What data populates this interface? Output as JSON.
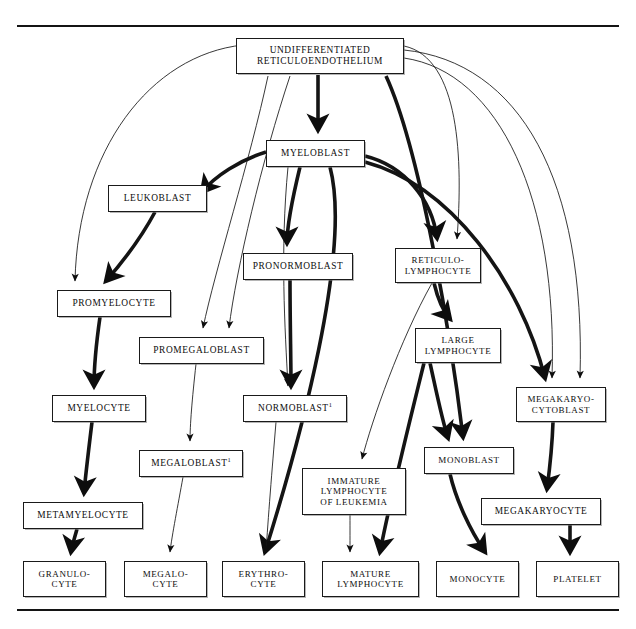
{
  "page": {
    "top_rule": true,
    "bottom_rule": true,
    "faint_header_text": "",
    "background_color": "#ffffff",
    "line_color": "#141414"
  },
  "nodes": [
    {
      "id": "undiff",
      "label": "UNDIFFERENTIATED\nRETICULOENDOTHELIUM",
      "x": 236,
      "y": 38,
      "w": 168,
      "h": 36,
      "font": 9.4
    },
    {
      "id": "myeloblast",
      "label": "MYELOBLAST",
      "x": 266,
      "y": 140,
      "w": 99,
      "h": 27,
      "font": 9.4
    },
    {
      "id": "leukoblast",
      "label": "LEUKOBLAST",
      "x": 108,
      "y": 185,
      "w": 99,
      "h": 27,
      "font": 9.4
    },
    {
      "id": "pronormoblast",
      "label": "PRONORMOBLAST",
      "x": 243,
      "y": 253,
      "w": 110,
      "h": 27,
      "font": 9.4
    },
    {
      "id": "reticulolymph",
      "label": "RETICULO-\nLYMPHOCYTE",
      "x": 395,
      "y": 248,
      "w": 86,
      "h": 35,
      "font": 9.0
    },
    {
      "id": "promyelocyte",
      "label": "PROMYELOCYTE",
      "x": 57,
      "y": 290,
      "w": 114,
      "h": 27,
      "font": 9.4
    },
    {
      "id": "promegalo",
      "label": "PROMEGALOBLAST",
      "x": 139,
      "y": 337,
      "w": 125,
      "h": 27,
      "font": 9.4
    },
    {
      "id": "largelymph",
      "label": "LARGE\nLYMPHOCYTE",
      "x": 415,
      "y": 328,
      "w": 86,
      "h": 35,
      "font": 9.0
    },
    {
      "id": "myelocyte",
      "label": "MYELOCYTE",
      "x": 52,
      "y": 395,
      "w": 94,
      "h": 27,
      "font": 9.4
    },
    {
      "id": "normoblast",
      "label": "NORMOBLAST¹",
      "x": 243,
      "y": 395,
      "w": 104,
      "h": 27,
      "font": 9.4
    },
    {
      "id": "megakaryoblast",
      "label": "MEGAKARYO-\nCYTOBLAST",
      "x": 516,
      "y": 387,
      "w": 90,
      "h": 35,
      "font": 9.0
    },
    {
      "id": "megaloblast",
      "label": "MEGALOBLAST¹",
      "x": 139,
      "y": 450,
      "w": 104,
      "h": 27,
      "font": 9.4
    },
    {
      "id": "immature",
      "label": "IMMATURE\nLYMPHOCYTE\nOF LEUKEMIA",
      "x": 302,
      "y": 468,
      "w": 104,
      "h": 47,
      "font": 9.0
    },
    {
      "id": "monoblast",
      "label": "MONOBLAST",
      "x": 424,
      "y": 447,
      "w": 90,
      "h": 27,
      "font": 9.0
    },
    {
      "id": "metamyelocyte",
      "label": "METAMYELOCYTE",
      "x": 23,
      "y": 502,
      "w": 120,
      "h": 27,
      "font": 9.4
    },
    {
      "id": "megakaryocyte",
      "label": "MEGAKARYOCYTE",
      "x": 481,
      "y": 498,
      "w": 120,
      "h": 27,
      "font": 9.4
    },
    {
      "id": "granulocyte",
      "label": "GRANULO-\nCYTE",
      "x": 23,
      "y": 561,
      "w": 83,
      "h": 36,
      "font": 9.0
    },
    {
      "id": "megalocyte",
      "label": "MEGALO-\nCYTE",
      "x": 124,
      "y": 561,
      "w": 83,
      "h": 36,
      "font": 9.0
    },
    {
      "id": "erythrocyte",
      "label": "ERYTHRO-\nCYTE",
      "x": 222,
      "y": 561,
      "w": 83,
      "h": 36,
      "font": 9.0
    },
    {
      "id": "maturelymph",
      "label": "MATURE\nLYMPHOCYTE",
      "x": 322,
      "y": 561,
      "w": 97,
      "h": 36,
      "font": 9.0
    },
    {
      "id": "monocyte",
      "label": "MONOCYTE",
      "x": 436,
      "y": 561,
      "w": 83,
      "h": 36,
      "font": 9.0
    },
    {
      "id": "platelet",
      "label": "PLATELET",
      "x": 536,
      "y": 561,
      "w": 83,
      "h": 36,
      "font": 9.0
    }
  ],
  "edges": [
    {
      "from": "undiff",
      "to": "myeloblast",
      "weight": "thick",
      "path": "M 318,75 C 318,100 318,112 318,130"
    },
    {
      "from": "undiff",
      "to": "promyelocyte",
      "weight": "thin",
      "path": "M 243,45 C 150,55 78,150 75,281"
    },
    {
      "from": "undiff",
      "to": "promegalo",
      "weight": "thin",
      "path": "M 268,76 C 250,160 215,270 203,328"
    },
    {
      "from": "undiff",
      "to": "promegalo",
      "weight": "thin",
      "path": "M 290,76 C 262,160 236,270 229,328"
    },
    {
      "from": "undiff",
      "to": "monoblast",
      "weight": "thick",
      "path": "M 386,76 C 420,150 450,330 463,437"
    },
    {
      "from": "undiff",
      "to": "reticulolymph",
      "weight": "thin",
      "path": "M 404,46 C 460,58 463,160 457,239"
    },
    {
      "from": "undiff",
      "to": "megakaryoblast",
      "weight": "thin",
      "path": "M 404,50 C 520,62 586,180 580,378"
    },
    {
      "from": "undiff",
      "to": "megakaryoblast",
      "weight": "thin",
      "path": "M 404,58 C 500,72 558,200 552,378"
    },
    {
      "from": "myeloblast",
      "to": "leukoblast",
      "weight": "thick",
      "path": "M 266,152 C 240,160 215,176 202,192"
    },
    {
      "from": "myeloblast",
      "to": "pronormoblast",
      "weight": "thick",
      "path": "M 300,167 C 292,200 287,226 287,243"
    },
    {
      "from": "myeloblast",
      "to": "erythrocyte",
      "weight": "thick",
      "path": "M 330,167 C 352,250 300,440 265,552"
    },
    {
      "from": "myeloblast",
      "to": "reticulolymph",
      "weight": "thick",
      "path": "M 365,156 C 405,166 432,200 437,238"
    },
    {
      "from": "myeloblast",
      "to": "megakaryoblast",
      "weight": "thick",
      "path": "M 365,162 C 450,185 520,280 545,378"
    },
    {
      "from": "myeloblast",
      "to": "normoblast",
      "weight": "thin",
      "path": "M 288,167 C 280,250 285,330 288,386"
    },
    {
      "from": "leukoblast",
      "to": "promyelocyte",
      "weight": "thick",
      "path": "M 155,212 C 140,240 120,265 106,281"
    },
    {
      "from": "promyelocyte",
      "to": "myelocyte",
      "weight": "thick",
      "path": "M 100,317 C 96,345 94,368 94,386"
    },
    {
      "from": "promegalo",
      "to": "megaloblast",
      "weight": "thin",
      "path": "M 196,364 C 192,400 190,425 190,441"
    },
    {
      "from": "pronormoblast",
      "to": "normoblast",
      "weight": "thick",
      "path": "M 290,280 C 290,320 291,360 291,386"
    },
    {
      "from": "reticulolymph",
      "to": "largelymph",
      "weight": "thick",
      "path": "M 434,283 C 438,300 444,312 450,319"
    },
    {
      "from": "reticulolymph",
      "to": "immature",
      "weight": "thin",
      "path": "M 432,283 C 400,340 372,420 362,459"
    },
    {
      "from": "largelymph",
      "to": "monoblast",
      "weight": "thick",
      "path": "M 430,363 C 436,390 442,420 448,438"
    },
    {
      "from": "largelymph",
      "to": "maturelymph",
      "weight": "thick",
      "path": "M 424,363 C 410,420 390,500 380,552"
    },
    {
      "from": "myelocyte",
      "to": "metamyelocyte",
      "weight": "thick",
      "path": "M 92,422 C 88,455 85,480 84,493"
    },
    {
      "from": "megaloblast",
      "to": "megalocyte",
      "weight": "thin",
      "path": "M 183,477 C 178,505 172,535 170,552"
    },
    {
      "from": "normoblast",
      "to": "erythrocyte",
      "weight": "thin",
      "path": "M 276,422 C 272,470 268,520 266,552"
    },
    {
      "from": "megakaryoblast",
      "to": "megakaryocyte",
      "weight": "thick",
      "path": "M 553,422 C 552,452 549,474 547,489"
    },
    {
      "from": "immature",
      "to": "maturelymph",
      "weight": "thin",
      "path": "M 350,515 C 350,530 350,543 350,552"
    },
    {
      "from": "monoblast",
      "to": "monocyte",
      "weight": "thick",
      "path": "M 450,474 C 456,500 470,530 485,552"
    },
    {
      "from": "metamyelocyte",
      "to": "granulocyte",
      "weight": "thick",
      "path": "M 77,529 C 74,540 72,546 71,552"
    },
    {
      "from": "megakaryocyte",
      "to": "platelet",
      "weight": "thick",
      "path": "M 570,525 C 570,536 570,545 570,552"
    }
  ]
}
